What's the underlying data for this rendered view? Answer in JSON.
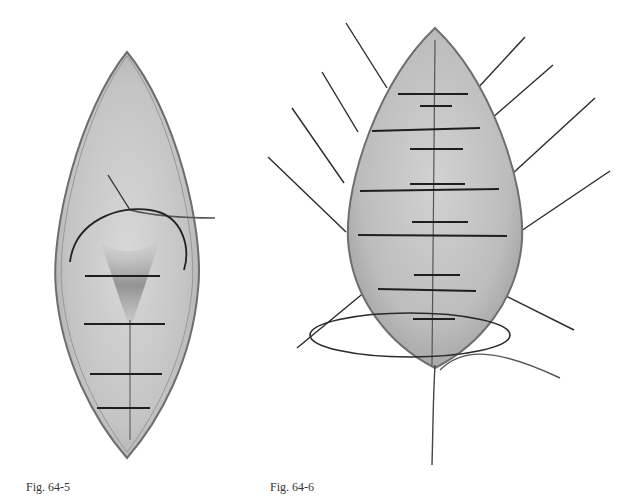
{
  "figures": [
    {
      "id": "fig-64-5",
      "caption": "Fig. 64-5",
      "subject": "elliptical wound with interrupted sutures being placed, needle and thread in upper portion",
      "suture_count": 4
    },
    {
      "id": "fig-64-6",
      "caption": "Fig. 64-6",
      "subject": "elliptical wound with multiple interrupted sutures, radiating suture ends and looped thread at bottom",
      "suture_count": 10
    }
  ],
  "colors": {
    "background": "#ffffff",
    "tissue": "#cfcfcf",
    "tissue_dark": "#8a8a8a",
    "outline": "#6e6e6e",
    "suture": "#1e1e1e"
  }
}
